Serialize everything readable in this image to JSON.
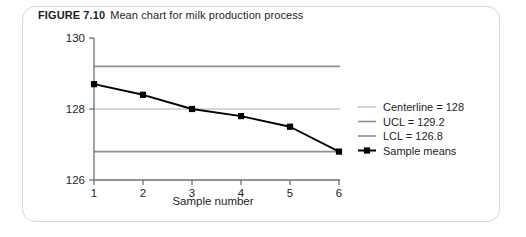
{
  "figure": {
    "label": "FIGURE 7.10",
    "caption": "Mean chart for milk production process"
  },
  "chart_data": {
    "type": "line",
    "title": "Mean chart for milk production process",
    "xlabel": "Sample number",
    "ylabel": "",
    "x": [
      1,
      2,
      3,
      4,
      5,
      6
    ],
    "xtick_labels": [
      "1",
      "2",
      "3",
      "4",
      "5",
      "6"
    ],
    "xlim": [
      1,
      6
    ],
    "ylim": [
      126,
      130
    ],
    "ytick_labels": [
      "126",
      "128",
      "130"
    ],
    "yticks": [
      126,
      128,
      130
    ],
    "grid": false,
    "legend_position": "right",
    "series": [
      {
        "name": "Sample means",
        "values": [
          128.7,
          128.4,
          128.0,
          127.8,
          127.5,
          126.8
        ],
        "color": "#000000",
        "marker": "square"
      }
    ],
    "reference_lines": [
      {
        "name": "Centerline",
        "value": 128,
        "color": "#c8c8c8"
      },
      {
        "name": "UCL",
        "value": 129.2,
        "color": "#8d8f91"
      },
      {
        "name": "LCL",
        "value": 126.8,
        "color": "#8d8f91"
      }
    ]
  },
  "legend": {
    "items": [
      {
        "label": "Centerline = 128",
        "swatch_color": "#c8c8c8",
        "marker": "none"
      },
      {
        "label": "UCL = 129.2",
        "swatch_color": "#8d8f91",
        "marker": "none"
      },
      {
        "label": "LCL = 126.8",
        "swatch_color": "#8d8f91",
        "marker": "none"
      },
      {
        "label": "Sample means",
        "swatch_color": "#000000",
        "marker": "square"
      }
    ]
  },
  "axes": {
    "x_title": "Sample number"
  }
}
